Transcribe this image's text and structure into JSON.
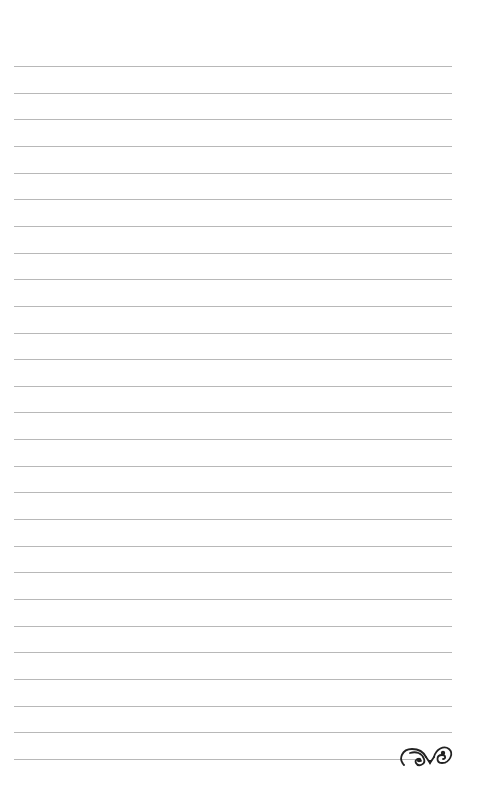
{
  "page": {
    "type": "lined-notebook-page",
    "background": "#ffffff",
    "line_color": "#b8b8b8",
    "line_count": 27,
    "first_line_y": 66,
    "line_spacing": 26.65,
    "line_left": 14,
    "line_right": 452,
    "last_line_right": 415
  },
  "ornament": {
    "icon": "flourish-scroll-icon",
    "color": "#222222"
  }
}
